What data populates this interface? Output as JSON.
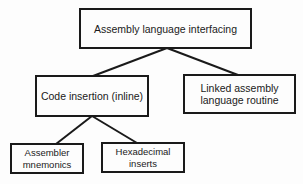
{
  "diagram": {
    "type": "tree",
    "nodes": {
      "root": {
        "label": "Assembly language interfacing"
      },
      "code_insertion": {
        "label": "Code insertion (inline)"
      },
      "linked_routine": {
        "label_line1": "Linked assembly",
        "label_line2": "language routine"
      },
      "assembler_mnemonics": {
        "label_line1": "Assembler",
        "label_line2": "mnemonics"
      },
      "hex_inserts": {
        "label_line1": "Hexadecimal",
        "label_line2": "inserts"
      }
    },
    "edges": [
      {
        "from": "root",
        "to": "code_insertion"
      },
      {
        "from": "root",
        "to": "linked_routine"
      },
      {
        "from": "code_insertion",
        "to": "assembler_mnemonics"
      },
      {
        "from": "code_insertion",
        "to": "hex_inserts"
      }
    ]
  }
}
